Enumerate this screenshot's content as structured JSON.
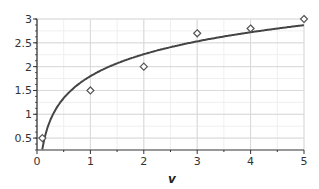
{
  "chart_data": {
    "type": "scatter",
    "title": "",
    "xlabel": "v",
    "ylabel": "",
    "xlim": [
      0,
      5
    ],
    "ylim": [
      0.25,
      3
    ],
    "grid": true,
    "legend": null,
    "x_ticks": [
      "0",
      "1",
      "2",
      "3",
      "4",
      "5"
    ],
    "y_ticks": [
      "0.5",
      "1",
      "1.5",
      "2",
      "2.5",
      "3"
    ],
    "series": [
      {
        "name": "data",
        "kind": "scatter",
        "marker": "diamond",
        "x": [
          0.1,
          1,
          2,
          3,
          4,
          5
        ],
        "y": [
          0.5,
          1.5,
          2.0,
          2.7,
          2.8,
          3.0
        ]
      },
      {
        "name": "fit",
        "kind": "line",
        "equation": "y = 1.8 + 0.665 ln(v)",
        "x": [
          0.1,
          0.2,
          0.3,
          0.5,
          0.75,
          1,
          1.5,
          2,
          2.5,
          3,
          3.5,
          4,
          4.5,
          5
        ],
        "y": [
          0.27,
          0.73,
          1.0,
          1.34,
          1.61,
          1.8,
          2.07,
          2.26,
          2.41,
          2.53,
          2.63,
          2.72,
          2.8,
          2.87
        ]
      }
    ],
    "colors": {
      "line": "#444444",
      "marker": "#555555",
      "grid": "#d9d9d9",
      "axis": "#333333"
    }
  }
}
